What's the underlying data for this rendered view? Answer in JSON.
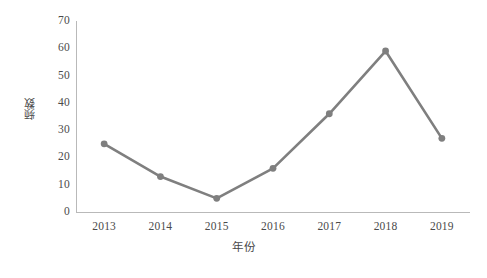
{
  "chart_data": {
    "type": "line",
    "title": "",
    "xlabel": "年份",
    "ylabel": "频数",
    "categories": [
      "2013",
      "2014",
      "2015",
      "2016",
      "2017",
      "2018",
      "2019"
    ],
    "values": [
      25,
      13,
      5,
      16,
      36,
      59,
      27
    ],
    "series": [
      {
        "name": "频数",
        "values": [
          25,
          13,
          5,
          16,
          36,
          59,
          27
        ]
      }
    ],
    "ylim": [
      0,
      70
    ],
    "yticks": [
      0,
      10,
      20,
      30,
      40,
      50,
      60,
      70
    ],
    "ytick_labels": [
      "0",
      "10",
      "20",
      "30",
      "40",
      "50",
      "60",
      "70"
    ],
    "grid": false,
    "legend": false,
    "legend_position": "none",
    "series_color": "#7f7f7f",
    "axis_color": "#b9b9b9",
    "background_color": "#ffffff",
    "marker": "circle",
    "annotations": []
  }
}
